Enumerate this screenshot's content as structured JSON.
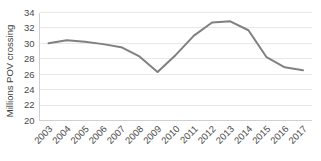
{
  "chart_data": {
    "type": "line",
    "title": "",
    "xlabel": "",
    "ylabel": "Millions POV crossing",
    "categories": [
      "2003",
      "2004",
      "2005",
      "2006",
      "2007",
      "2008",
      "2009",
      "2010",
      "2011",
      "2012",
      "2013",
      "2014",
      "2015",
      "2016",
      "2017"
    ],
    "values": [
      30.0,
      30.4,
      30.2,
      29.9,
      29.5,
      28.3,
      26.3,
      28.5,
      31.0,
      32.7,
      32.85,
      31.7,
      28.2,
      26.9,
      26.5
    ],
    "series": [
      {
        "name": "Millions POV crossing",
        "values": [
          30.0,
          30.4,
          30.2,
          29.9,
          29.5,
          28.3,
          26.3,
          28.5,
          31.0,
          32.7,
          32.85,
          31.7,
          28.2,
          26.9,
          26.5
        ],
        "color": "#808080"
      }
    ],
    "ylim": [
      20,
      34
    ],
    "ytick_values": [
      20,
      22,
      24,
      26,
      28,
      30,
      32,
      34
    ],
    "ytick_labels": [
      "20",
      "22",
      "24",
      "26",
      "28",
      "30",
      "32",
      "34"
    ],
    "grid": true,
    "grid_axis": "y",
    "grid_color": "#e8e8e8",
    "legend": false,
    "legend_position": "none",
    "line_color": "#808080",
    "line_width": 2,
    "markers": false,
    "xtick_rotation": -45,
    "axis_color": "#d0d0d0",
    "background_color": "#ffffff"
  },
  "axis": {
    "y_title": "Millions POV crossing"
  }
}
